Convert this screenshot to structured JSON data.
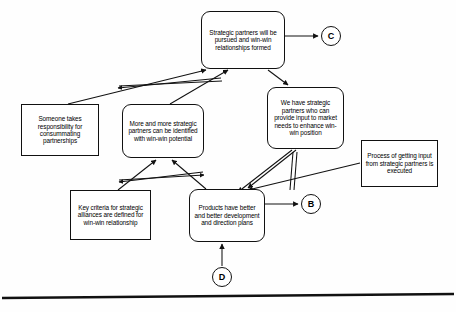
{
  "diagram": {
    "ink_color": "#111111",
    "background_color": "#ffffff",
    "nodes": [
      {
        "id": "strategic-partners-pursued",
        "name": "node-strategic-partners-pursued",
        "text": "Strategic partners will be pursued and win-win relationships formed",
        "shape": "rounded-rectangle",
        "x": 201,
        "y": 11,
        "w": 84,
        "h": 58,
        "font_size": 6.4
      },
      {
        "id": "someone-takes-responsibility",
        "name": "node-someone-takes-responsibility",
        "text": "Someone takes responsibility for consummating partnerships",
        "shape": "rectangle",
        "x": 21,
        "y": 104,
        "w": 78,
        "h": 52,
        "font_size": 6.4
      },
      {
        "id": "more-and-more-partners",
        "name": "node-more-and-more-strategic-partners",
        "text": "More and more strategic partners can be identified with win-win potential",
        "shape": "rounded-rectangle",
        "x": 122,
        "y": 104,
        "w": 82,
        "h": 54,
        "font_size": 6.4
      },
      {
        "id": "we-have-strategic-partners",
        "name": "node-we-have-strategic-partners",
        "text": "We have strategic partners who can provide input to market needs to enhance win-win position",
        "shape": "rounded-rectangle",
        "x": 267,
        "y": 87,
        "w": 77,
        "h": 62,
        "font_size": 6.4
      },
      {
        "id": "process-getting-input",
        "name": "node-process-of-getting-input",
        "text": "Process of getting input from strategic partners is executed",
        "shape": "rectangle",
        "x": 361,
        "y": 140,
        "w": 77,
        "h": 47,
        "font_size": 6.4
      },
      {
        "id": "key-criteria-alliances",
        "name": "node-key-criteria-strategic-alliances",
        "text": "Key criteria for strategic alliances are defined for win-win relationship",
        "shape": "rectangle",
        "x": 70,
        "y": 190,
        "w": 81,
        "h": 50,
        "font_size": 6.4
      },
      {
        "id": "products-have-better",
        "name": "node-products-have-better-plans",
        "text": "Products have better and better development and direction plans",
        "shape": "rounded-rectangle",
        "x": 189,
        "y": 189,
        "w": 76,
        "h": 53,
        "font_size": 6.4
      }
    ],
    "connectors": [
      {
        "id": "conn-c",
        "name": "connector-circle-c",
        "label": "C",
        "cx": 331,
        "cy": 36,
        "r": 10,
        "font_size": 9
      },
      {
        "id": "conn-b",
        "name": "connector-circle-b",
        "label": "B",
        "cx": 311,
        "cy": 204,
        "r": 10,
        "font_size": 9
      },
      {
        "id": "conn-d",
        "name": "connector-circle-d",
        "label": "D",
        "cx": 222,
        "cy": 277,
        "r": 10,
        "font_size": 9
      }
    ],
    "edges": [
      {
        "id": "e1",
        "name": "edge-strategic-partners-to-c",
        "from": "strategic-partners-pursued",
        "to": "conn-c",
        "arrow": "single"
      },
      {
        "id": "e2",
        "name": "edge-someone-responsibility-to-strategic-partners",
        "from": "someone-takes-responsibility",
        "to": "strategic-partners-pursued",
        "arrow": "single"
      },
      {
        "id": "e3",
        "name": "edge-more-partners-to-strategic-partners",
        "from": "more-and-more-partners",
        "to": "strategic-partners-pursued",
        "arrow": "single"
      },
      {
        "id": "e4",
        "name": "edge-crosslink-upper-bowtie",
        "from": "more-and-more-partners",
        "to": "someone-takes-responsibility",
        "arrow": "double"
      },
      {
        "id": "e5",
        "name": "edge-strategic-partners-to-we-have-partners",
        "from": "strategic-partners-pursued",
        "to": "we-have-strategic-partners",
        "arrow": "single"
      },
      {
        "id": "e6",
        "name": "edge-we-have-partners-to-products",
        "from": "we-have-strategic-partners",
        "to": "products-have-better",
        "arrow": "single"
      },
      {
        "id": "e7",
        "name": "edge-we-have-partners-to-lower-left",
        "from": "we-have-strategic-partners",
        "to": "products-have-better",
        "arrow": "single"
      },
      {
        "id": "e8",
        "name": "edge-process-input-to-products",
        "from": "process-getting-input",
        "to": "products-have-better",
        "arrow": "single"
      },
      {
        "id": "e9",
        "name": "edge-products-to-b",
        "from": "products-have-better",
        "to": "conn-b",
        "arrow": "single"
      },
      {
        "id": "e10",
        "name": "edge-d-to-products",
        "from": "conn-d",
        "to": "products-have-better",
        "arrow": "single"
      },
      {
        "id": "e11",
        "name": "edge-key-criteria-to-more-partners",
        "from": "key-criteria-alliances",
        "to": "more-and-more-partners",
        "arrow": "single"
      },
      {
        "id": "e12",
        "name": "edge-products-to-more-partners",
        "from": "products-have-better",
        "to": "more-and-more-partners",
        "arrow": "single"
      },
      {
        "id": "e13",
        "name": "edge-crosslink-lower-bowtie",
        "from": "key-criteria-alliances",
        "to": "products-have-better",
        "arrow": "double"
      }
    ],
    "page_edge": {
      "name": "page-bottom-edge",
      "y": 296
    }
  }
}
